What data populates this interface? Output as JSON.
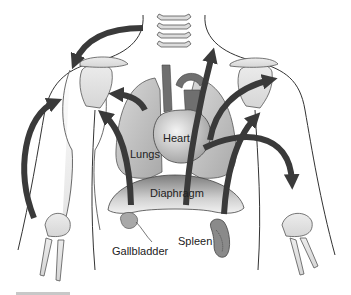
{
  "diagram": {
    "type": "anatomical-referred-pain",
    "labels": {
      "heart": "Heart",
      "lungs": "Lungs",
      "diaphragm": "Diaphragm",
      "gallbladder": "Gallbladder",
      "spleen": "Spleen"
    },
    "colors": {
      "arrow": "#3a3a3a",
      "outline": "#333333",
      "bone": "#e4e4e4",
      "organ": "#bdbdbd",
      "organ_dark": "#7a7a7a",
      "lung": "#c9c9c9",
      "background": "#ffffff"
    },
    "arrows": [
      {
        "from": "neck",
        "to": "left-shoulder"
      },
      {
        "from": "left-forearm",
        "to": "left-shoulder"
      },
      {
        "from": "diaphragm-left",
        "to": "left-shoulder"
      },
      {
        "from": "lungs-left",
        "to": "left-shoulder"
      },
      {
        "from": "diaphragm-center",
        "to": "neck"
      },
      {
        "from": "heart",
        "to": "right-shoulder"
      },
      {
        "from": "spleen",
        "to": "right-shoulder"
      },
      {
        "from": "heart",
        "to": "right-forearm"
      }
    ]
  }
}
